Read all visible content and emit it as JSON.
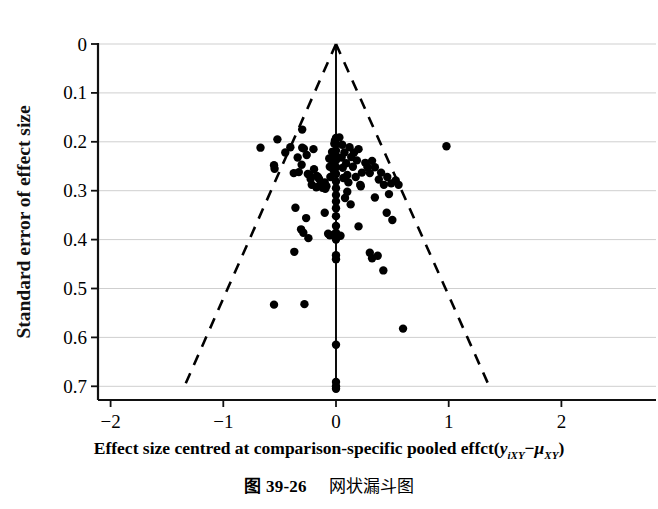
{
  "figure": {
    "caption_number": "图 39-26",
    "caption_text": "网状漏斗图"
  },
  "axis": {
    "x_label_prefix": "Effect size centred at comparison-specific pooled effct(",
    "x_label_y": "y",
    "x_label_y_sub": "iXY",
    "x_label_minus": "−",
    "x_label_mu": "μ",
    "x_label_mu_sub": "XY",
    "x_label_suffix": ")",
    "y_label": "Standard error of effect size"
  },
  "chart_data": {
    "type": "scatter",
    "title": "",
    "subtitle": "",
    "xlabel": "Effect size centred at comparison-specific pooled effct(yiXY−μXY)",
    "ylabel": "Standard error of effect size",
    "xlim": [
      -2,
      2
    ],
    "ylim": [
      0,
      0.7
    ],
    "y_axis_inverted": true,
    "xticks": [
      "−2",
      "−1",
      "0",
      "1",
      "2"
    ],
    "xtick_values": [
      -2,
      -1,
      0,
      1,
      2
    ],
    "yticks": [
      "0",
      "0.1",
      "0.2",
      "0.3",
      "0.4",
      "0.5",
      "0.6",
      "0.7"
    ],
    "ytick_values": [
      0,
      0.1,
      0.2,
      0.3,
      0.4,
      0.5,
      0.6,
      0.7
    ],
    "grid": "horizontal",
    "grid_color": "#cfcfcf",
    "legend": "none",
    "marker_color": "#000000",
    "marker_size_px": 5.2,
    "reference_line": {
      "name": "pooled-effect-line",
      "x": 0,
      "y_from": 0,
      "y_to": 0.705,
      "style": "solid",
      "color": "#000000"
    },
    "funnel_bounds": {
      "name": "95-percent-pseudo-confidence-limits",
      "apex": [
        0,
        0
      ],
      "slope": 1.96,
      "left_end": [
        -1.345,
        0.7
      ],
      "right_end": [
        1.36,
        0.7
      ],
      "style": "dashed",
      "color": "#000000"
    },
    "points": [
      [
        -0.67,
        0.212
      ],
      [
        -0.52,
        0.195
      ],
      [
        -0.3,
        0.175
      ],
      [
        -0.55,
        0.248
      ],
      [
        -0.545,
        0.255
      ],
      [
        -0.45,
        0.222
      ],
      [
        -0.405,
        0.211
      ],
      [
        -0.375,
        0.264
      ],
      [
        -0.34,
        0.232
      ],
      [
        -0.33,
        0.262
      ],
      [
        -0.305,
        0.247
      ],
      [
        -0.3,
        0.212
      ],
      [
        -0.285,
        0.214
      ],
      [
        -0.26,
        0.227
      ],
      [
        -0.25,
        0.266
      ],
      [
        -0.235,
        0.268
      ],
      [
        -0.225,
        0.276
      ],
      [
        -0.2,
        0.215
      ],
      [
        -0.195,
        0.256
      ],
      [
        -0.175,
        0.293
      ],
      [
        -0.17,
        0.27
      ],
      [
        -0.16,
        0.272
      ],
      [
        -0.15,
        0.276
      ],
      [
        -0.14,
        0.289
      ],
      [
        -0.125,
        0.285
      ],
      [
        -0.12,
        0.294
      ],
      [
        -0.115,
        0.29
      ],
      [
        -0.1,
        0.283
      ],
      [
        -0.095,
        0.296
      ],
      [
        -0.085,
        0.291
      ],
      [
        -0.215,
        0.288
      ],
      [
        -0.06,
        0.234
      ],
      [
        -0.055,
        0.251
      ],
      [
        -0.05,
        0.272
      ],
      [
        -0.035,
        0.221
      ],
      [
        -0.03,
        0.243
      ],
      [
        -0.02,
        0.259
      ],
      [
        -0.015,
        0.204
      ],
      [
        -0.01,
        0.198
      ],
      [
        -0.005,
        0.226
      ],
      [
        0.0,
        0.192
      ],
      [
        0.0,
        0.205
      ],
      [
        0.0,
        0.218
      ],
      [
        0.0,
        0.238
      ],
      [
        0.0,
        0.252
      ],
      [
        0.0,
        0.266
      ],
      [
        0.0,
        0.281
      ],
      [
        0.0,
        0.295
      ],
      [
        0.0,
        0.309
      ],
      [
        0.0,
        0.322
      ],
      [
        0.0,
        0.336
      ],
      [
        0.03,
        0.191
      ],
      [
        0.055,
        0.206
      ],
      [
        0.05,
        0.232
      ],
      [
        0.06,
        0.253
      ],
      [
        0.065,
        0.274
      ],
      [
        0.075,
        0.222
      ],
      [
        0.09,
        0.244
      ],
      [
        0.1,
        0.268
      ],
      [
        0.11,
        0.283
      ],
      [
        0.12,
        0.211
      ],
      [
        0.135,
        0.231
      ],
      [
        0.15,
        0.251
      ],
      [
        0.16,
        0.222
      ],
      [
        0.175,
        0.272
      ],
      [
        0.185,
        0.238
      ],
      [
        0.2,
        0.215
      ],
      [
        0.215,
        0.288
      ],
      [
        0.23,
        0.263
      ],
      [
        0.26,
        0.243
      ],
      [
        0.28,
        0.252
      ],
      [
        0.3,
        0.264
      ],
      [
        0.32,
        0.239
      ],
      [
        0.345,
        0.252
      ],
      [
        0.38,
        0.277
      ],
      [
        0.4,
        0.263
      ],
      [
        0.425,
        0.288
      ],
      [
        0.455,
        0.272
      ],
      [
        0.49,
        0.285
      ],
      [
        0.53,
        0.279
      ],
      [
        0.555,
        0.288
      ],
      [
        0.98,
        0.209
      ],
      [
        -0.36,
        0.335
      ],
      [
        -0.265,
        0.356
      ],
      [
        -0.31,
        0.379
      ],
      [
        -0.29,
        0.386
      ],
      [
        -0.245,
        0.397
      ],
      [
        -0.1,
        0.345
      ],
      [
        -0.07,
        0.388
      ],
      [
        -0.055,
        0.391
      ],
      [
        -0.02,
        0.39
      ],
      [
        0.0,
        0.352
      ],
      [
        0.0,
        0.372
      ],
      [
        0.0,
        0.386
      ],
      [
        0.0,
        0.4
      ],
      [
        0.0,
        0.432
      ],
      [
        0.0,
        0.44
      ],
      [
        0.04,
        0.392
      ],
      [
        0.08,
        0.315
      ],
      [
        0.1,
        0.302
      ],
      [
        0.13,
        0.328
      ],
      [
        0.2,
        0.373
      ],
      [
        0.22,
        0.291
      ],
      [
        0.3,
        0.427
      ],
      [
        0.32,
        0.438
      ],
      [
        0.345,
        0.314
      ],
      [
        0.37,
        0.433
      ],
      [
        0.42,
        0.463
      ],
      [
        0.45,
        0.345
      ],
      [
        0.47,
        0.307
      ],
      [
        0.5,
        0.36
      ],
      [
        -0.37,
        0.425
      ],
      [
        -0.55,
        0.533
      ],
      [
        -0.28,
        0.532
      ],
      [
        0.595,
        0.582
      ],
      [
        0.0,
        0.615
      ],
      [
        0.0,
        0.691
      ],
      [
        0.0,
        0.7
      ],
      [
        0.0,
        0.705
      ]
    ]
  }
}
